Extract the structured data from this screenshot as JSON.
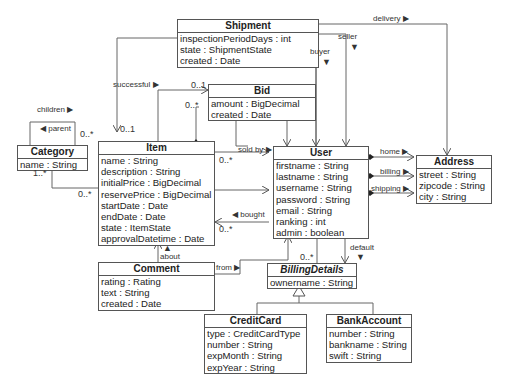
{
  "classes": {
    "shipment": {
      "name": "Shipment",
      "attrs": [
        "inspectionPeriodDays : int",
        "state : ShipmentState",
        "created : Date"
      ]
    },
    "bid": {
      "name": "Bid",
      "attrs": [
        "amount : BigDecimal",
        "created : Date"
      ]
    },
    "category": {
      "name": "Category",
      "attrs": [
        "name : String"
      ]
    },
    "item": {
      "name": "Item",
      "attrs": [
        "name : String",
        "description : String",
        "initialPrice : BigDecimal",
        "reservePrice : BigDecimal",
        "startDate : Date",
        "endDate : Date",
        "state : ItemState",
        "approvalDatetime : Date"
      ]
    },
    "user": {
      "name": "User",
      "attrs": [
        "firstname : String",
        "lastname : String",
        "username : String",
        "password : String",
        "email : String",
        "ranking : int",
        "admin : boolean"
      ]
    },
    "address": {
      "name": "Address",
      "attrs": [
        "street : String",
        "zipcode : String",
        "city : String"
      ]
    },
    "comment": {
      "name": "Comment",
      "attrs": [
        "rating : Rating",
        "text : String",
        "created : Date"
      ]
    },
    "billingdetails": {
      "name": "BillingDetails",
      "attrs": [
        "ownername : String"
      ]
    },
    "creditcard": {
      "name": "CreditCard",
      "attrs": [
        "type : CreditCardType",
        "number : String",
        "expMonth : String",
        "expYear : String"
      ]
    },
    "bankaccount": {
      "name": "BankAccount",
      "attrs": [
        "number : String",
        "bankname : String",
        "swift : String"
      ]
    }
  },
  "labels": {
    "delivery": "delivery ▶",
    "seller": "seller",
    "buyer": "buyer",
    "children": "children ▶",
    "parent": "◀ parent",
    "successful": "successful ▶",
    "sold_by": "sold by ▶",
    "bought": "◀ bought",
    "home": "home ▶",
    "billing": "billing ▶",
    "shipping": "shipping ▶",
    "about": "about",
    "from": "from ▶",
    "default": "default",
    "down_arrow": "▼",
    "up_arrow": "▲"
  },
  "multiplicities": {
    "shipment_item": "0..1",
    "cat_children": "0..*",
    "cat_item_cat": "1..*",
    "cat_item_item": "0..*",
    "bid_successful": "0..1",
    "bid_item": "0..*",
    "item_soldby": "0..*",
    "item_bought": "0..*",
    "user_billing": "0..*"
  }
}
